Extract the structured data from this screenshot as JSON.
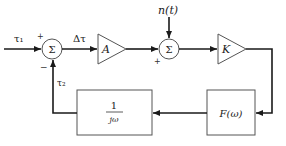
{
  "diagram": {
    "type": "block-diagram",
    "inputs": {
      "tau1": "τ₁",
      "noise": "n(t)"
    },
    "signals": {
      "delta_tau": "Δτ",
      "tau2": "τ₂"
    },
    "summers": [
      {
        "id": "sum1",
        "symbol": "Σ",
        "signs": {
          "top_left": "+",
          "bottom_left": "−"
        }
      },
      {
        "id": "sum2",
        "symbol": "Σ",
        "signs": {
          "bottom_left": "+"
        }
      }
    ],
    "gains": [
      {
        "id": "amp-a",
        "label": "A"
      },
      {
        "id": "amp-k",
        "label": "K"
      }
    ],
    "blocks": [
      {
        "id": "loop-filter",
        "label": "F(ω)"
      },
      {
        "id": "integrator",
        "numerator": "1",
        "denominator": "jω"
      }
    ],
    "connections": [
      "τ₁ → Σ1 (+)",
      "Σ1 → Δτ → A",
      "A → Σ2 (+)",
      "n(t) → Σ2",
      "Σ2 → K",
      "K → F(ω)",
      "F(ω) → 1/jω",
      "1/jω → τ₂ → Σ1 (−)"
    ],
    "colors": {
      "line": "#1a1a1a",
      "block_border": "#555555",
      "background": "#ffffff"
    }
  }
}
